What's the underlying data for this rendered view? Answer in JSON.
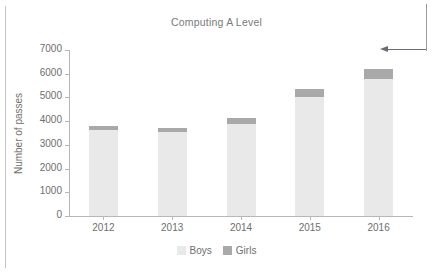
{
  "chart_data": {
    "type": "bar",
    "subtype": "stacked",
    "title": "Computing A Level",
    "xlabel": "",
    "ylabel": "Number of passes",
    "categories": [
      "2012",
      "2013",
      "2014",
      "2015",
      "2016"
    ],
    "series": [
      {
        "name": "Boys",
        "color": "#e9e9e9",
        "values": [
          3620,
          3540,
          3900,
          5000,
          5770
        ]
      },
      {
        "name": "Girls",
        "color": "#a9a9a9",
        "values": [
          160,
          160,
          220,
          340,
          430
        ]
      }
    ],
    "totals": [
      3780,
      3700,
      4120,
      5340,
      6200
    ],
    "ylim": [
      0,
      7000
    ],
    "yticks": [
      "0",
      "1000",
      "2000",
      "3000",
      "4000",
      "5000",
      "6000",
      "7000"
    ],
    "ytick_values": [
      0,
      1000,
      2000,
      3000,
      4000,
      5000,
      6000,
      7000
    ],
    "grid": false,
    "legend_position": "bottom"
  },
  "annotation": {
    "arrow_label": "",
    "arrow_direction": "left"
  }
}
